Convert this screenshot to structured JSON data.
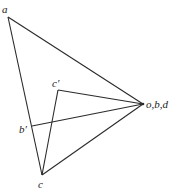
{
  "diagram": {
    "type": "vector-diagram",
    "points": [
      {
        "id": "a",
        "label": "a",
        "x": 8,
        "y": 17,
        "label_x": 2,
        "label_y": 13
      },
      {
        "id": "obd",
        "label": "o,b,d",
        "x": 143,
        "y": 104,
        "label_x": 146,
        "label_y": 108
      },
      {
        "id": "c",
        "label": "c",
        "x": 42,
        "y": 175,
        "label_x": 38,
        "label_y": 188
      },
      {
        "id": "c_prime",
        "label": "c′",
        "x": 58,
        "y": 90,
        "label_x": 52,
        "label_y": 87
      },
      {
        "id": "b_prime",
        "label": "b′",
        "x": 32,
        "y": 126,
        "label_x": 19,
        "label_y": 133
      }
    ],
    "segments": [
      {
        "from": "a",
        "to": "obd"
      },
      {
        "from": "a",
        "to": "c"
      },
      {
        "from": "c",
        "to": "obd"
      },
      {
        "from": "c_prime",
        "to": "obd"
      },
      {
        "from": "c_prime",
        "to": "c"
      },
      {
        "from": "b_prime",
        "to": "obd"
      }
    ],
    "stroke_color": "#2a2a2a",
    "background": "#ffffff"
  }
}
